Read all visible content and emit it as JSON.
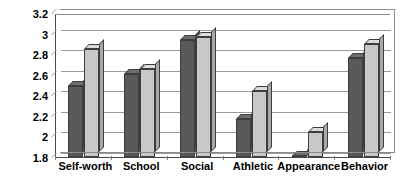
{
  "chart_data": {
    "type": "bar",
    "title": "",
    "xlabel": "",
    "ylabel": "Mean score",
    "ylim": [
      1.8,
      3.2
    ],
    "ytick_step": 0.2,
    "yticks": [
      "3.2",
      "3",
      "2.8",
      "2.6",
      "2.4",
      "2.2",
      "2",
      "1.8"
    ],
    "ytick_values": [
      3.2,
      3.0,
      2.8,
      2.6,
      2.4,
      2.2,
      2.0,
      1.8
    ],
    "grid": true,
    "legend": "none",
    "categories": [
      "Self-worth",
      "School",
      "Social",
      "Athletic",
      "Appearance",
      "Behavior"
    ],
    "series": [
      {
        "name": "series-1",
        "color": "#595959",
        "values": [
          2.49,
          2.61,
          2.94,
          2.17,
          1.81,
          2.76
        ]
      },
      {
        "name": "series-2",
        "color": "#c8c8c8",
        "values": [
          2.85,
          2.66,
          2.97,
          2.44,
          2.04,
          2.9
        ]
      }
    ]
  },
  "axis": {
    "y_title": "Mean score"
  }
}
